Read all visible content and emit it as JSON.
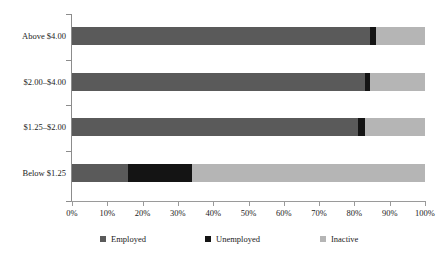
{
  "chart_data": {
    "type": "bar",
    "orientation": "horizontal",
    "stacked": true,
    "normalized_percent": true,
    "title": "",
    "subtitle": "",
    "xlabel": "",
    "ylabel": "",
    "xlim": [
      0,
      100
    ],
    "xtick_labels": [
      "0%",
      "10%",
      "20%",
      "30%",
      "40%",
      "50%",
      "60%",
      "70%",
      "80%",
      "90%",
      "100%"
    ],
    "xtick_values": [
      0,
      10,
      20,
      30,
      40,
      50,
      60,
      70,
      80,
      90,
      100
    ],
    "grid": false,
    "legend_position": "bottom",
    "categories": [
      "Above $4.00",
      "$2.00–$4.00",
      "$1.25–$2.00",
      "Below $1.25"
    ],
    "series": [
      {
        "name": "Employed",
        "color": "#5a5a5a",
        "values": [
          84.5,
          83.0,
          81.0,
          16.0
        ]
      },
      {
        "name": "Unemployed",
        "color": "#141414",
        "values": [
          1.5,
          1.5,
          2.0,
          18.0
        ]
      },
      {
        "name": "Inactive",
        "color": "#b5b5b5",
        "values": [
          14.0,
          15.5,
          17.0,
          66.0
        ]
      }
    ],
    "axis_color": "#8c8c8c",
    "background": "#ffffff"
  },
  "legend": {
    "items": [
      {
        "label": "Employed",
        "color": "#5a5a5a"
      },
      {
        "label": "Unemployed",
        "color": "#141414"
      },
      {
        "label": "Inactive",
        "color": "#b5b5b5"
      }
    ]
  }
}
